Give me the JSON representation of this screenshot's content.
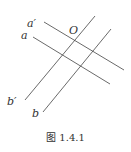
{
  "diagram": {
    "lines": [
      {
        "id": "a_prime",
        "label": "a′",
        "x1": 44,
        "y1": 22,
        "x2": 124,
        "y2": 70
      },
      {
        "id": "a",
        "label": "a",
        "x1": 33,
        "y1": 37,
        "x2": 110,
        "y2": 84
      },
      {
        "id": "b_prime",
        "label": "b′",
        "x1": 25,
        "y1": 100,
        "x2": 95,
        "y2": 16
      },
      {
        "id": "b",
        "label": "b",
        "x1": 43,
        "y1": 112,
        "x2": 111,
        "y2": 29
      }
    ],
    "labels": {
      "a_prime": "a′",
      "a": "a",
      "O": "O",
      "b_prime": "b′",
      "b": "b"
    },
    "point_O": "O",
    "stroke_color": "#444444"
  },
  "caption": "图 1.4.1"
}
